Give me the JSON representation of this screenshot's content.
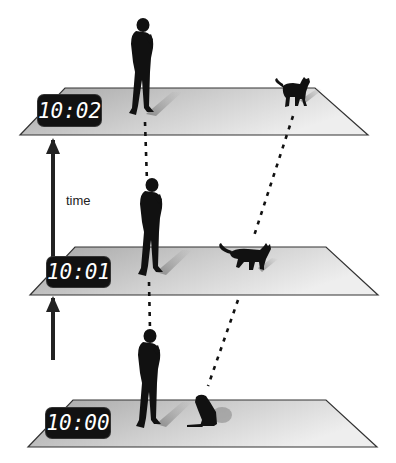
{
  "diagram": {
    "axis_label": "time",
    "colors": {
      "plane_fill_top": "#a8a8a8",
      "plane_fill_bottom": "#ececec",
      "plane_stroke": "#333333",
      "clock_bg": "#111111",
      "clock_text": "#ffffff",
      "silhouette": "#111111",
      "dots": "#111111"
    },
    "frames": [
      {
        "time": "10:02",
        "man": "standing",
        "cat": "standing"
      },
      {
        "time": "10:01",
        "man": "standing",
        "cat": "walking"
      },
      {
        "time": "10:00",
        "man": "standing",
        "cat": "sitting"
      }
    ]
  }
}
